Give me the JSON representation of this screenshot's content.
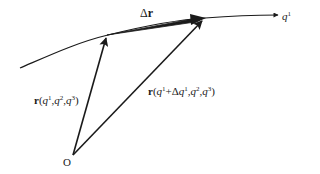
{
  "diagram": {
    "stroke_color": "#1a1a1a",
    "background": "#ffffff",
    "curve": {
      "name": "coordinate-curve-q1",
      "axis_label": "q",
      "axis_label_sup": "1"
    },
    "origin": {
      "label": "O"
    },
    "vectors": {
      "r": {
        "bold": "r",
        "open": "(",
        "q1": "q",
        "q1_sup": "1",
        "sep1": ",",
        "q2": "q",
        "q2_sup": "2",
        "sep2": ",",
        "q3": "q",
        "q3_sup": "3",
        "close": ")"
      },
      "r_shifted": {
        "bold": "r",
        "open": "(",
        "q1": "q",
        "q1_sup": "1",
        "plus": "+Δ",
        "dq1": "q",
        "dq1_sup": "1",
        "sep1": ",",
        "q2": "q",
        "q2_sup": "2",
        "sep2": ",",
        "q3": "q",
        "q3_sup": "3",
        "close": ")"
      },
      "delta_r": {
        "delta": "Δ",
        "bold": "r"
      }
    }
  }
}
